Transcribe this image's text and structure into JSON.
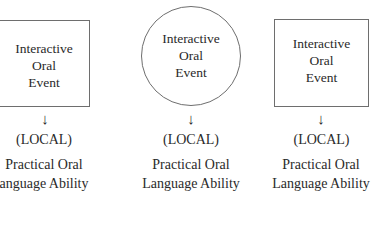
{
  "columns": [
    {
      "shape": "square",
      "label_lines": [
        "Interactive",
        "Oral",
        "Event"
      ],
      "arrow": "↓",
      "context": "(LOCAL)",
      "ability_lines": [
        "Practical Oral",
        "anguage Ability"
      ]
    },
    {
      "shape": "circle",
      "label_lines": [
        "Interactive",
        "Oral",
        "Event"
      ],
      "arrow": "↓",
      "context": "(LOCAL)",
      "ability_lines": [
        "Practical Oral",
        "Language Ability"
      ]
    },
    {
      "shape": "square",
      "label_lines": [
        "Interactive",
        "Oral",
        "Event"
      ],
      "arrow": "↓",
      "context": "(LOCAL)",
      "ability_lines": [
        "Practical Oral",
        "Language Ability"
      ]
    }
  ],
  "colors": {
    "stroke": "#6e6e6e",
    "text": "#2a2a2a",
    "background": "#ffffff"
  }
}
